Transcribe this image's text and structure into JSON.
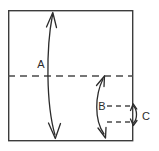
{
  "figure": {
    "type": "technical-dimension-diagram",
    "background_color": "#ffffff",
    "line_color": "#2b2b2b",
    "dash_color": "#4a4a4a",
    "frame_color": "#3c3c3c"
  },
  "frame": {
    "name": "outer-rectangle",
    "x": 8,
    "y": 10,
    "width": 125,
    "height": 131
  },
  "reference_lines": [
    {
      "id": "centerline",
      "style": "dashed",
      "x1": 8,
      "y1": 76,
      "x2": 133,
      "y2": 76
    },
    {
      "id": "upper-short-dash",
      "style": "dashed",
      "x1": 106,
      "y1": 106,
      "x2": 133,
      "y2": 106
    },
    {
      "id": "lower-short-dash",
      "style": "dashed",
      "x1": 106,
      "y1": 122,
      "x2": 133,
      "y2": 122
    }
  ],
  "dimensions": [
    {
      "id": "A",
      "label": "A",
      "label_x": 41,
      "label_y": 65,
      "from_y": 12,
      "to_y": 138,
      "arrowheads": "both",
      "description": "full height of rectangle"
    },
    {
      "id": "B",
      "label": "B",
      "label_x": 102,
      "label_y": 107,
      "from_y": 76,
      "to_y": 138,
      "arrowheads": "both",
      "description": "centerline to bottom"
    },
    {
      "id": "C",
      "label": "C",
      "label_x": 146,
      "label_y": 117,
      "from_y": 104,
      "to_y": 124,
      "arrowheads": "both",
      "description": "gap between the two short dashed lines"
    }
  ]
}
